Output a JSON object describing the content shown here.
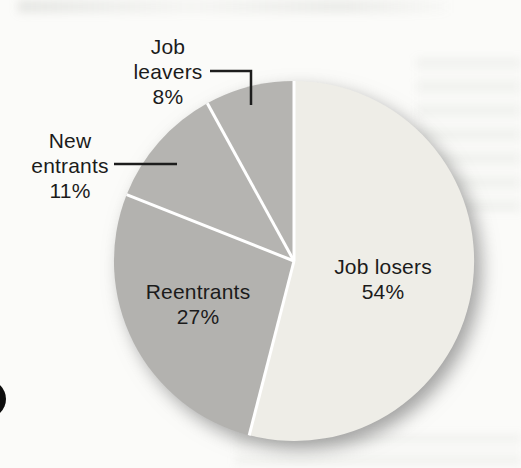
{
  "chart_data": {
    "type": "pie",
    "direction": "clockwise",
    "start_angle_deg": 0,
    "legend": "none",
    "grid": false,
    "separator_color": "#ffffff",
    "label_text_color": "#1b1b1b",
    "slices": [
      {
        "id": "job-losers",
        "label": "Job losers",
        "pct": "54%",
        "value": 54,
        "color": "#eeede7",
        "label_placement": "inside"
      },
      {
        "id": "reentrants",
        "label": "Reentrants",
        "pct": "27%",
        "value": 27,
        "color": "#b3b2af",
        "label_placement": "inside"
      },
      {
        "id": "new-entrants",
        "label": "New entrants",
        "pct": "11%",
        "value": 11,
        "color": "#b5b4b1",
        "label_placement": "outside-left",
        "label_lines": [
          "New",
          "entrants",
          "11%"
        ]
      },
      {
        "id": "job-leavers",
        "label": "Job leavers",
        "pct": "8%",
        "value": 8,
        "color": "#b5b4b1",
        "label_placement": "outside-top",
        "label_lines": [
          "Job",
          "leavers",
          "8%"
        ]
      }
    ],
    "pie_geometry": {
      "cx": 294,
      "cy": 261,
      "r": 180
    },
    "shadow": {
      "offset_x": 7,
      "offset_y": 8,
      "blur": 9,
      "color": "rgba(104,104,104,0.6)"
    }
  },
  "artifacts": {
    "edge_bullet_color": "#0d0d0d",
    "leader_line_color": "#1d1d1d"
  }
}
